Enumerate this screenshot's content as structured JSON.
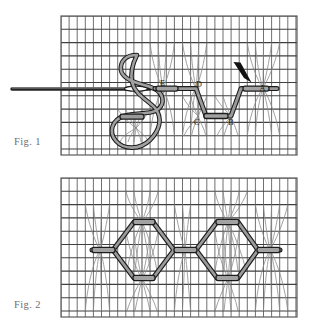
{
  "document": {
    "title": "Embroidery stitch diagram",
    "background_color": "#ffffff",
    "panel_count": 2
  },
  "captions": {
    "fig1": "Fig. 1",
    "fig2": "Fig. 2"
  },
  "colors": {
    "background": "#ffffff",
    "canvas_grid_line": "#4a4a4a",
    "canvas_grid_thread": "#8c8c8c",
    "thread_outline": "#1c1c1c",
    "thread_fill": "#9a9a9a",
    "needle": "#2b2b2b",
    "arrow": "#111111",
    "caption_text": "#6f6f6f",
    "label_text": "#1b1b1b",
    "panel_border": "#5a5a5a"
  },
  "panels": [
    {
      "name": "fig1",
      "caption": "Fig. 1",
      "x": 61,
      "y": 16,
      "width": 236,
      "height": 139,
      "grid": {
        "vertical_spacing": 8.1,
        "horizontal_spacing": 13.3
      },
      "description": "Working the stitch: needle with thread forms a zigzag of stitches along the canvas; loop of slack thread hangs below.",
      "point_labels": [
        {
          "id": "A",
          "text": "A",
          "x": 263,
          "y": 88
        },
        {
          "id": "B",
          "text": "B",
          "x": 228,
          "y": 118
        },
        {
          "id": "C",
          "text": "C",
          "x": 196,
          "y": 118
        },
        {
          "id": "D",
          "text": "D",
          "x": 196,
          "y": 88
        },
        {
          "id": "E",
          "text": "E",
          "x": 163,
          "y": 86
        }
      ],
      "needle": {
        "label": "sewing-needle",
        "tip_x": 12,
        "eye_x": 146,
        "y": 89
      },
      "arrow": {
        "label": "direction-arrow",
        "from_x": 237,
        "from_y": 64,
        "to_x": 250,
        "to_y": 82
      }
    },
    {
      "name": "fig2",
      "caption": "Fig. 2",
      "x": 61,
      "y": 178,
      "width": 236,
      "height": 139,
      "grid": {
        "vertical_spacing": 8.1,
        "horizontal_spacing": 13.3
      },
      "description": "Completed row: the stitches form a chain of elongated hexagons (diamond lattice) with short horizontal bar stitches at each junction."
    }
  ],
  "annotations": {
    "stitch_points_order": [
      "A",
      "B",
      "C",
      "D",
      "E"
    ],
    "stitch_count_fig2": 2
  }
}
